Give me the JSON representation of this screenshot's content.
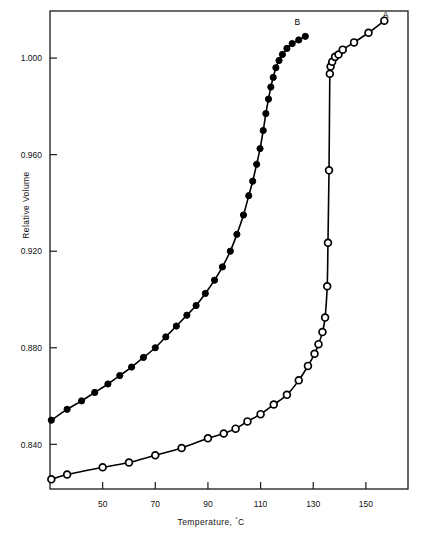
{
  "chart_data": {
    "type": "line",
    "title": "",
    "xlabel": "Temperature, °C",
    "ylabel": "Relative Volume",
    "xlabel_text": "Temperature, ",
    "xlabel_unit": "C",
    "xlabel_degree": "°",
    "xlim": [
      30,
      166
    ],
    "ylim": [
      0.8215,
      1.0195
    ],
    "grid": false,
    "legend": "inline-curve-labels",
    "xticks": [
      50,
      70,
      90,
      110,
      130,
      150
    ],
    "xtick_labels": [
      "50",
      "70",
      "90",
      "110",
      "130",
      "150"
    ],
    "yticks": [
      0.84,
      0.88,
      0.92,
      0.96,
      1.0
    ],
    "ytick_labels": [
      "0.840",
      "0.880",
      "0.920",
      "0.960",
      "1.000"
    ],
    "series": [
      {
        "name": "A",
        "label": "A",
        "marker": "open-circle",
        "marker_fill": "#ffffff",
        "marker_stroke": "#000000",
        "label_x": 157.5,
        "label_y": 1.0165,
        "x": [
          30.5,
          36.5,
          50.0,
          60.0,
          70.0,
          80.0,
          90.0,
          96.0,
          100.5,
          105.0,
          110.0,
          115.0,
          120.0,
          124.5,
          128.0,
          130.5,
          132.0,
          133.5,
          134.5,
          135.3,
          135.6,
          136.0,
          136.3,
          136.6,
          137.2,
          138.3,
          139.6,
          141.2,
          145.5,
          151.0,
          157.0
        ],
        "y": [
          0.8255,
          0.8275,
          0.8305,
          0.8325,
          0.8355,
          0.8385,
          0.8425,
          0.8445,
          0.8465,
          0.8495,
          0.8525,
          0.8565,
          0.8605,
          0.8665,
          0.8725,
          0.8775,
          0.8815,
          0.8865,
          0.8925,
          0.9055,
          0.9235,
          0.9535,
          0.9935,
          0.9965,
          0.9985,
          1.0005,
          1.0015,
          1.0035,
          1.0065,
          1.0105,
          1.0155
        ]
      },
      {
        "name": "B",
        "label": "B",
        "marker": "filled-circle",
        "marker_fill": "#000000",
        "marker_stroke": "#000000",
        "label_x": 124.0,
        "label_y": 1.0135,
        "x": [
          30.5,
          36.5,
          42.0,
          47.0,
          52.0,
          56.5,
          61.0,
          65.5,
          70.0,
          74.0,
          78.0,
          82.0,
          85.5,
          89.0,
          92.5,
          95.5,
          98.5,
          101.0,
          103.5,
          105.5,
          107.0,
          108.5,
          109.8,
          111.0,
          112.0,
          113.0,
          113.9,
          114.8,
          115.8,
          117.0,
          118.3,
          120.0,
          122.0,
          124.5,
          127.0
        ],
        "y": [
          0.85,
          0.8545,
          0.858,
          0.8615,
          0.865,
          0.8685,
          0.872,
          0.876,
          0.88,
          0.8845,
          0.889,
          0.8935,
          0.8975,
          0.9025,
          0.908,
          0.9135,
          0.92,
          0.927,
          0.935,
          0.943,
          0.949,
          0.956,
          0.9625,
          0.97,
          0.977,
          0.983,
          0.988,
          0.992,
          0.996,
          0.999,
          1.0015,
          1.004,
          1.006,
          1.0075,
          1.009
        ]
      }
    ]
  },
  "axis": {
    "frame_color": "#1a1a1a",
    "tick_color": "#1a1a1a"
  }
}
